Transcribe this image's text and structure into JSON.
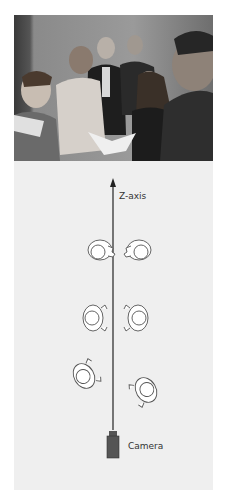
{
  "figure": {
    "photo": {
      "description": "Black-and-white photograph of a group of people standing and looking at a book",
      "people_count": 6
    },
    "diagram": {
      "axis_label": "Z-axis",
      "camera_label": "Camera",
      "figures": [
        {
          "pair": "top",
          "positions": [
            "left",
            "right"
          ],
          "facing": "each-other"
        },
        {
          "pair": "middle",
          "positions": [
            "left",
            "right"
          ],
          "facing": "each-other"
        },
        {
          "pair": "bottom",
          "positions": [
            "left",
            "right"
          ],
          "facing": "each-other-angled"
        }
      ],
      "colors": {
        "panel": "#efefef",
        "axis": "#222222",
        "camera": "#555555"
      }
    }
  }
}
